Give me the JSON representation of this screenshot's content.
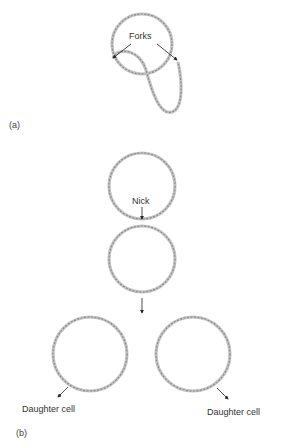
{
  "panels": {
    "a": {
      "label": "(a)"
    },
    "b": {
      "label": "(b)"
    }
  },
  "labels": {
    "forks": "Forks",
    "nick": "Nick",
    "daughter_left": "Daughter cell",
    "daughter_right": "Daughter cell"
  },
  "colors": {
    "strand": "#8c8c8c",
    "strand_light": "#c4c4c4",
    "arrow": "#222222",
    "text": "#333333"
  }
}
